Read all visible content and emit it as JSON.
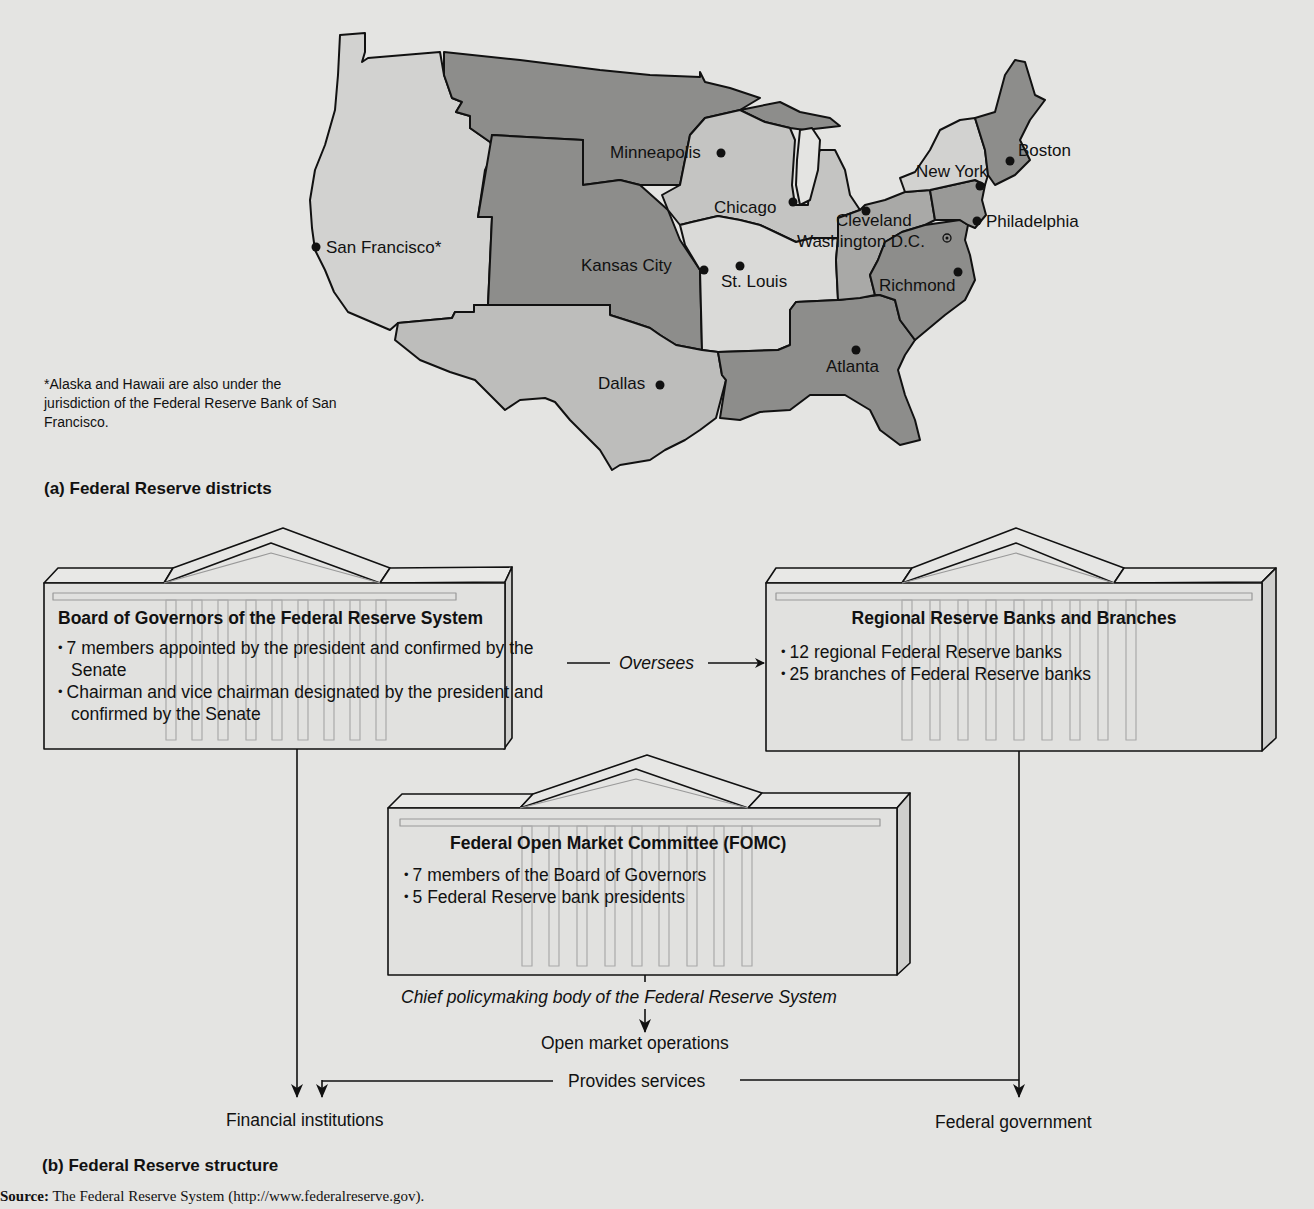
{
  "figure": {
    "top_text_fragment": "(cut-off text at top of page)",
    "source_label": "Source:",
    "source_text": "The Federal Reserve System (http://www.federalreserve.gov)."
  },
  "map_panel": {
    "caption": "(a)  Federal Reserve districts",
    "footnote": "*Alaska and Hawaii are also under the jurisdiction of the Federal Reserve Bank of San Francisco.",
    "shading": {
      "light": "#d2d2d0",
      "medium": "#a9a9a7",
      "dark": "#8d8d8b",
      "border": "#111111"
    },
    "cities": [
      {
        "id": "san-francisco",
        "label": "San Francisco*"
      },
      {
        "id": "minneapolis",
        "label": "Minneapolis"
      },
      {
        "id": "chicago",
        "label": "Chicago"
      },
      {
        "id": "kansas-city",
        "label": "Kansas City"
      },
      {
        "id": "st-louis",
        "label": "St. Louis"
      },
      {
        "id": "dallas",
        "label": "Dallas"
      },
      {
        "id": "atlanta",
        "label": "Atlanta"
      },
      {
        "id": "cleveland",
        "label": "Cleveland"
      },
      {
        "id": "richmond",
        "label": "Richmond"
      },
      {
        "id": "washington-dc",
        "label": "Washington D.C."
      },
      {
        "id": "philadelphia",
        "label": "Philadelphia"
      },
      {
        "id": "new-york",
        "label": "New York"
      },
      {
        "id": "boston",
        "label": "Boston"
      }
    ]
  },
  "structure_panel": {
    "caption": "(b)  Federal Reserve structure",
    "board": {
      "title": "Board of Governors of the Federal Reserve System",
      "bullets": [
        "7 members appointed by the president and confirmed by the Senate",
        "Chairman and vice chairman designated by the president and confirmed by the Senate"
      ]
    },
    "regional": {
      "title": "Regional Reserve Banks and Branches",
      "bullets": [
        "12 regional Federal Reserve banks",
        "25 branches of Federal Reserve banks"
      ]
    },
    "fomc": {
      "title": "Federal Open Market Committee (FOMC)",
      "bullets": [
        "7 members of the Board of Governors",
        "5 Federal Reserve bank presidents"
      ],
      "subtitle": "Chief policymaking body of the Federal Reserve System"
    },
    "flows": {
      "oversees": "Oversees",
      "open_market_operations": "Open market operations",
      "provides_services": "Provides services",
      "financial_institutions": "Financial institutions",
      "federal_government": "Federal government"
    }
  }
}
